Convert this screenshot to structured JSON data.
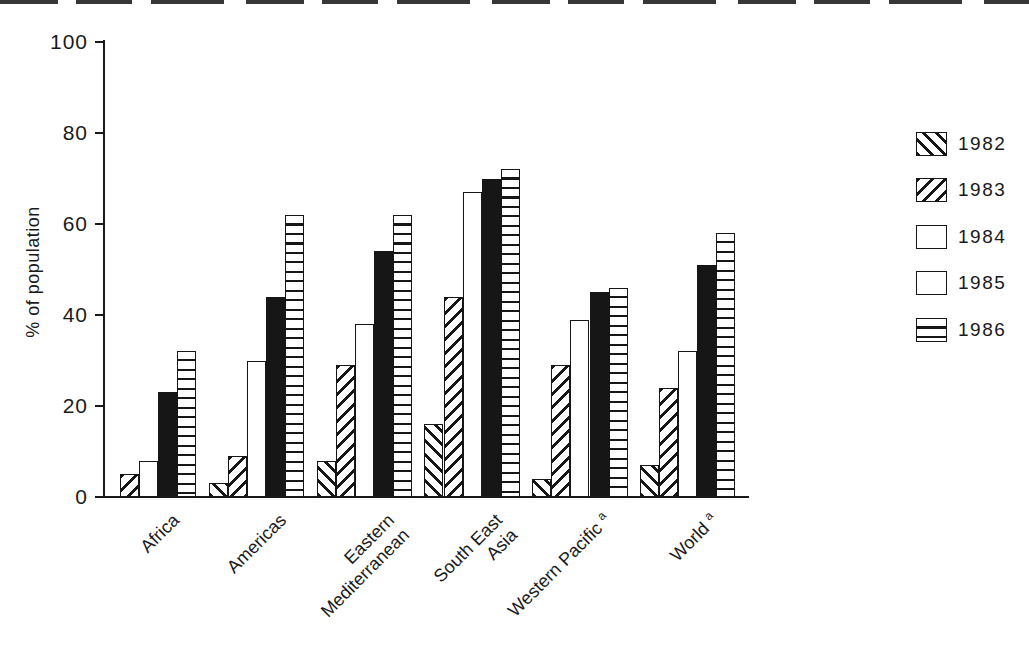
{
  "colors": {
    "ink": "#1a1a1a",
    "paper": "#ffffff"
  },
  "chart_data": {
    "type": "bar",
    "title": "",
    "xlabel": "",
    "ylabel": "% of population",
    "ylim": [
      0,
      100
    ],
    "yticks": [
      0,
      20,
      40,
      60,
      80,
      100
    ],
    "grid": false,
    "legend_position": "right",
    "categories": [
      {
        "id": "africa",
        "label": "Africa",
        "lines": [
          "Africa"
        ],
        "superscript": ""
      },
      {
        "id": "americas",
        "label": "Americas",
        "lines": [
          "Americas"
        ],
        "superscript": ""
      },
      {
        "id": "eastern-mediterranean",
        "label": "Eastern Mediterranean",
        "lines": [
          "Eastern",
          "Mediterranean"
        ],
        "superscript": ""
      },
      {
        "id": "south-east-asia",
        "label": "South East Asia",
        "lines": [
          "South East",
          "Asia"
        ],
        "superscript": ""
      },
      {
        "id": "western-pacific",
        "label": "Western Pacific",
        "lines": [
          "Western Pacific"
        ],
        "superscript": "a"
      },
      {
        "id": "world",
        "label": "World",
        "lines": [
          "World"
        ],
        "superscript": "a"
      }
    ],
    "series": [
      {
        "name": "1982",
        "pattern": "diagonal-backslash-hatch",
        "values": [
          null,
          3,
          8,
          16,
          4,
          7
        ]
      },
      {
        "name": "1983",
        "pattern": "diagonal-slash-hatch",
        "values": [
          5,
          9,
          29,
          44,
          29,
          24
        ]
      },
      {
        "name": "1984",
        "pattern": "open-white",
        "values": [
          8,
          30,
          38,
          67,
          39,
          32
        ]
      },
      {
        "name": "1985",
        "pattern": "solid-black",
        "values": [
          23,
          44,
          54,
          70,
          45,
          51
        ]
      },
      {
        "name": "1986",
        "pattern": "horizontal-line-hatch",
        "values": [
          32,
          62,
          62,
          72,
          46,
          58
        ]
      }
    ]
  }
}
